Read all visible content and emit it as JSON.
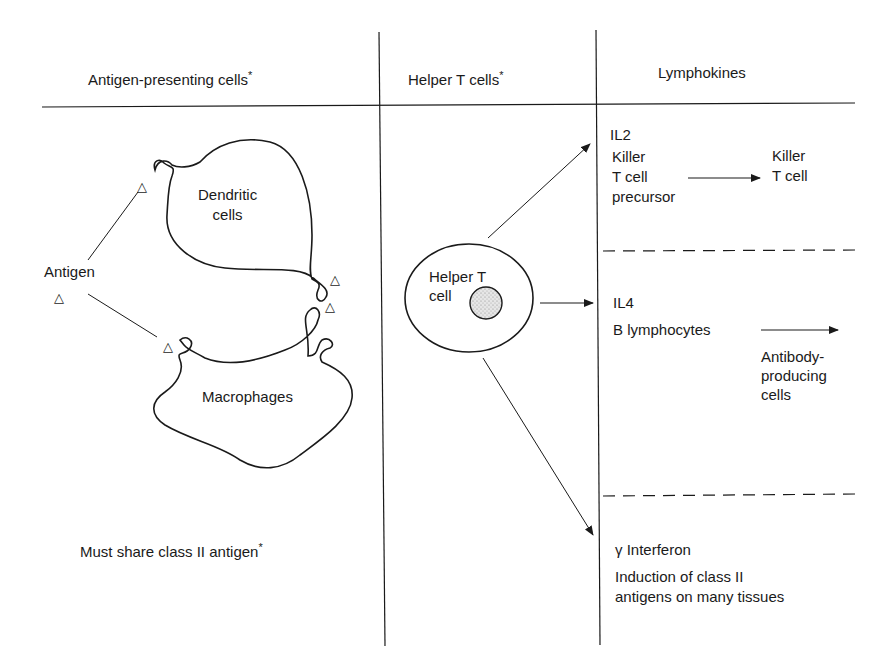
{
  "headers": {
    "col1": "Antigen-presenting cells",
    "col1_mark": "*",
    "col2": "Helper T cells",
    "col2_mark": "*",
    "col3": "Lymphokines"
  },
  "apc": {
    "antigen_label": "Antigen",
    "antigen_symbol": "△",
    "dendritic_label": "Dendritic\ncells",
    "macrophage_label": "Macrophages",
    "footnote": "Must share class II antigen",
    "footnote_mark": "*"
  },
  "helper": {
    "cell_label": "Helper T\ncell"
  },
  "lymphokines": [
    {
      "name": "IL2",
      "source": "Killer\nT cell\nprecursor",
      "target": "Killer\nT cell"
    },
    {
      "name": "IL4",
      "source": "B lymphocytes",
      "target": "Antibody-\nproducing\ncells"
    },
    {
      "name": "γ Interferon",
      "effect": "Induction of class II\nantigens on many tissues"
    }
  ],
  "colors": {
    "ink": "#1a1a1a",
    "nucleus_fill": "#d9d9d9",
    "background": "#ffffff"
  }
}
